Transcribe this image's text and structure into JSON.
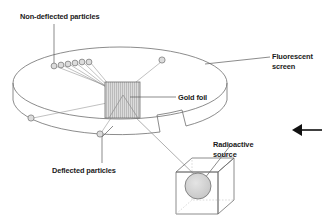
{
  "diagram": {
    "type": "schematic-diagram"
  },
  "labels": {
    "non_deflected": "Non-deflected particles",
    "fluorescent_line1": "Fluorescent",
    "fluorescent_line2": "screen",
    "gold_foil": "Gold foil",
    "deflected": "Deflected particles",
    "radioactive_line1": "Radioactive",
    "radioactive_line2": "source"
  },
  "colors": {
    "stroke": "#6b6b6b",
    "stroke_dark": "#3d3d3d",
    "text": "#1a1a1a",
    "foil_fill": "#d9d9d9",
    "foil_hatch": "#9a9a9a",
    "particle_fill": "#d6d6d6",
    "source_fill": "#cfcfcf",
    "background": "#ffffff",
    "arrow": "#000000"
  },
  "elements": {
    "fluorescent_screen": {
      "name": "fluorescent-screen-ring",
      "shape": "open cylindrical band / ellipse with gap at lower right"
    },
    "gold_foil": {
      "name": "gold-foil-target",
      "shape": "vertically hatched square with beam cone triangle"
    },
    "radioactive_source": {
      "name": "radioactive-source-box",
      "shape": "wireframe cube containing shaded sphere"
    },
    "direction_arrow": {
      "name": "direction-arrow",
      "shape": "left pointing arrow at right edge"
    }
  },
  "particles": {
    "non_deflected_count": 6,
    "non_deflected_points": [
      {
        "x": 54,
        "y": 65
      },
      {
        "x": 61,
        "y": 64
      },
      {
        "x": 68,
        "y": 63
      },
      {
        "x": 75,
        "y": 62
      },
      {
        "x": 82,
        "y": 62
      },
      {
        "x": 89,
        "y": 61
      }
    ],
    "deflected_count": 3,
    "deflected_points": [
      {
        "x": 162,
        "y": 60
      },
      {
        "x": 31,
        "y": 118
      },
      {
        "x": 100,
        "y": 135
      }
    ]
  }
}
